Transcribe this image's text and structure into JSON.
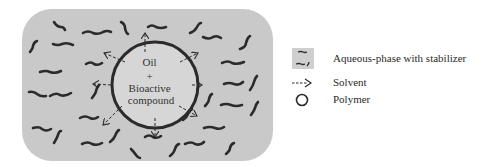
{
  "diagram": {
    "droplet_label": {
      "line1": "Oil",
      "line2": "+",
      "line3": "Bioactive",
      "line4": "compound"
    },
    "colors": {
      "aqueous_fill": "#c9c9c9",
      "droplet_fill": "#d6d6d6",
      "stroke": "#2b2b2b"
    }
  },
  "legend": {
    "items": [
      {
        "icon": "aqueous-phase-swatch-icon",
        "label": "Aqueous-phase with stabilizer"
      },
      {
        "icon": "dashed-arrow-icon",
        "label": "Solvent"
      },
      {
        "icon": "circle-icon",
        "label": "Polymer"
      }
    ]
  }
}
